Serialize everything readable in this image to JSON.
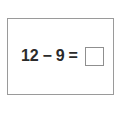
{
  "worksheet": {
    "problem": {
      "operand_left": "12",
      "operator_subtract": "−",
      "operand_right": "9",
      "operator_equals": "=",
      "answer_value": "",
      "answer_placeholder": ""
    },
    "colors": {
      "background": "#ffffff",
      "card_border": "#9a9a9a",
      "text": "#2b2b2b",
      "answer_box_border": "#8f8f8f"
    }
  }
}
